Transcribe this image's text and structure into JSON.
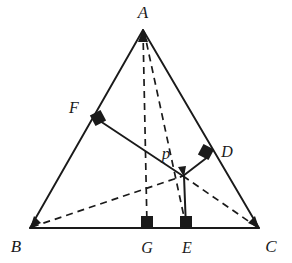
{
  "figure": {
    "type": "geometry-diagram",
    "background_color": "#ffffff",
    "stroke_color": "#1a1a1a",
    "label_color": "#1a1a1a",
    "solid_stroke_width": 1.8,
    "dashed_stroke_width": 1.7,
    "dash_pattern": "7 5"
  },
  "points": {
    "A": {
      "label": "A",
      "x": 143,
      "y": 29,
      "label_x": 143,
      "label_y": 16,
      "font_size": 17
    },
    "B": {
      "label": "B",
      "x": 30,
      "y": 228,
      "label_x": 17,
      "label_y": 250,
      "font_size": 17
    },
    "C": {
      "label": "C",
      "x": 259,
      "y": 228,
      "label_x": 270,
      "label_y": 250,
      "font_size": 17
    },
    "D": {
      "label": "D",
      "x": 207,
      "y": 154,
      "label_x": 226,
      "label_y": 155,
      "font_size": 16
    },
    "E": {
      "label": "E",
      "x": 186,
      "y": 228,
      "label_x": 186,
      "label_y": 251,
      "font_size": 16
    },
    "F": {
      "label": "F",
      "x": 96,
      "y": 117,
      "label_x": 73,
      "label_y": 110,
      "font_size": 16
    },
    "G": {
      "label": "G",
      "x": 147,
      "y": 228,
      "label_x": 147,
      "label_y": 251,
      "font_size": 16
    },
    "P": {
      "label": "p",
      "x": 183,
      "y": 176,
      "label_x": 165,
      "label_y": 157,
      "font_size": 16
    }
  },
  "segments": {
    "solid": [
      {
        "name": "side-AB",
        "from": "A",
        "to": "B"
      },
      {
        "name": "side-AC",
        "from": "A",
        "to": "C"
      },
      {
        "name": "side-BC",
        "from": "B",
        "to": "C"
      },
      {
        "name": "segment-FP",
        "from": "F",
        "to": "P"
      },
      {
        "name": "segment-PD",
        "from": "P",
        "to": "D"
      },
      {
        "name": "segment-PE",
        "from": "P",
        "to": "E"
      }
    ],
    "dashed": [
      {
        "name": "cevian-AG",
        "from": "A",
        "to": "G"
      },
      {
        "name": "cevian-AP-extended",
        "from": "A",
        "to": "E"
      },
      {
        "name": "cevian-BP",
        "from": "B",
        "to": "P"
      },
      {
        "name": "cevian-PC",
        "from": "P",
        "to": "C"
      }
    ]
  },
  "right_angle_marks": [
    {
      "name": "right-angle-at-F",
      "x": 96,
      "y": 117,
      "size": 12,
      "rotation": -28
    },
    {
      "name": "right-angle-at-D",
      "x": 206,
      "y": 152,
      "size": 12,
      "rotation": 28
    },
    {
      "name": "right-angle-at-G",
      "x": 147,
      "y": 222,
      "size": 12,
      "rotation": 0
    },
    {
      "name": "right-angle-at-E",
      "x": 186,
      "y": 222,
      "size": 12,
      "rotation": 0
    }
  ],
  "arrow_heads": [
    {
      "name": "arrowhead-at-A",
      "x": 143,
      "y": 31,
      "rotation": 180
    },
    {
      "name": "arrowhead-at-B",
      "x": 32,
      "y": 227,
      "rotation": 245
    },
    {
      "name": "arrowhead-at-C",
      "x": 257,
      "y": 227,
      "rotation": 295
    },
    {
      "name": "arrowhead-at-P",
      "x": 183,
      "y": 175,
      "rotation": 120
    }
  ]
}
